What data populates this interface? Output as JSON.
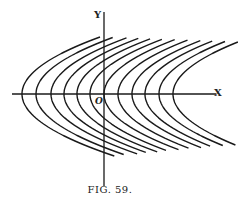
{
  "figure": {
    "caption": "FIG. 59.",
    "axis_labels": {
      "x": "X",
      "y": "Y",
      "origin": "O"
    },
    "vertices_x_px": [
      22,
      36,
      51,
      64,
      77,
      90,
      104,
      118,
      132,
      145,
      159,
      173
    ],
    "stroke_color": "#1a1a1a"
  }
}
